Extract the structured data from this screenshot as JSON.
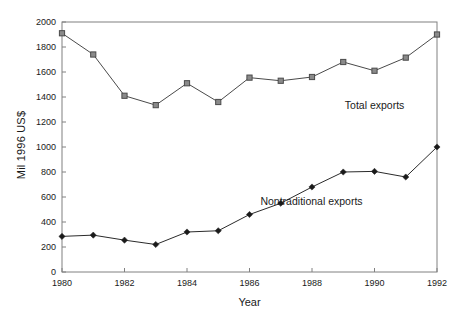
{
  "chart_data": {
    "type": "line",
    "title": "",
    "xlabel": "Year",
    "ylabel": "Mil 1996 US$",
    "x": [
      1980,
      1981,
      1982,
      1983,
      1984,
      1985,
      1986,
      1987,
      1988,
      1989,
      1990,
      1991,
      1992
    ],
    "xlim": [
      1980,
      1992
    ],
    "ylim": [
      0,
      2000
    ],
    "xticks": [
      1980,
      1982,
      1984,
      1986,
      1988,
      1990,
      1992
    ],
    "xtick_labels": [
      "1980",
      "1982",
      "1984",
      "1986",
      "1988",
      "1990",
      "1992"
    ],
    "yticks": [
      0,
      200,
      400,
      600,
      800,
      1000,
      1200,
      1400,
      1600,
      1800,
      2000
    ],
    "ytick_labels": [
      "0",
      "200",
      "400",
      "600",
      "800",
      "1000",
      "1200",
      "1400",
      "1600",
      "1800",
      "2000"
    ],
    "grid": false,
    "legend_position": "inline-annotation",
    "series": [
      {
        "name": "Total exports",
        "marker": "square",
        "color": "#4a4a4a",
        "marker_fill": "#8a8a8a",
        "annotation_x": 1989.05,
        "annotation_y": 1330,
        "values": [
          1910,
          1740,
          1410,
          1335,
          1510,
          1360,
          1555,
          1530,
          1560,
          1680,
          1610,
          1715,
          1900
        ]
      },
      {
        "name": "Nontraditional exports",
        "marker": "diamond",
        "color": "#2b2b2b",
        "marker_fill": "#1a1a1a",
        "annotation_x": 1986.35,
        "annotation_y": 560,
        "values": [
          285,
          295,
          255,
          220,
          320,
          330,
          460,
          550,
          680,
          800,
          805,
          760,
          1000
        ]
      }
    ]
  }
}
